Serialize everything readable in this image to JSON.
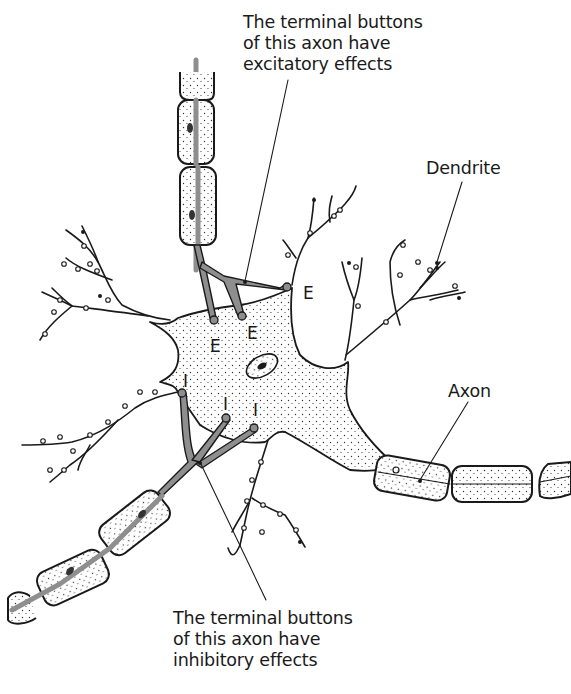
{
  "labels": {
    "excitatory_caption": "The terminal buttons\nof this axon have\nexcitatory effects",
    "inhibitory_caption": "The terminal buttons\nof this axon have\ninhibitory effects",
    "dendrite": "Dendrite",
    "axon": "Axon"
  },
  "synapse_marks": {
    "excitatory": [
      "E",
      "E",
      "E"
    ],
    "inhibitory": [
      "I",
      "I",
      "I"
    ]
  },
  "colors": {
    "ink": "#1a1a1a",
    "axon_core": "#8e8e8e",
    "background": "#ffffff"
  }
}
